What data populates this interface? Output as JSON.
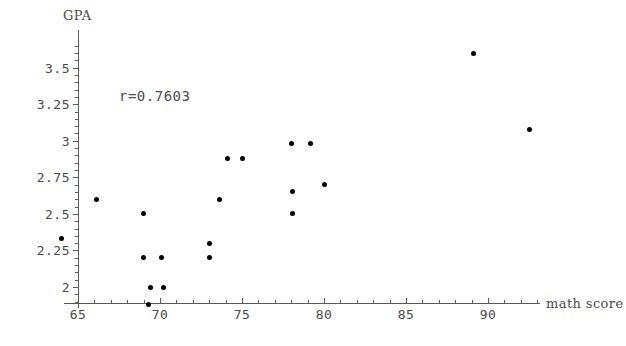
{
  "chart_data": {
    "type": "scatter",
    "title": "",
    "xlabel": "math score",
    "ylabel": "GPA",
    "xlim": [
      63.2,
      92.2
    ],
    "ylim": [
      1.88,
      3.72
    ],
    "xticks": [
      65,
      70,
      75,
      80,
      85,
      90
    ],
    "xtick_labels": [
      "65",
      "70",
      "75",
      "80",
      "85",
      "90"
    ],
    "yticks": [
      2,
      2.25,
      2.5,
      2.75,
      3,
      3.25,
      3.5
    ],
    "ytick_labels": [
      "2",
      "2.25",
      "2.5",
      "2.75",
      "3",
      "3.25",
      "3.5"
    ],
    "grid": false,
    "legend": null,
    "annotations": [
      {
        "name": "correlation",
        "text": "r=0.7603",
        "x": 66.5,
        "y": 3.23
      }
    ],
    "series": [
      {
        "name": "students",
        "marker": "circle",
        "color": "#000000",
        "points": [
          {
            "x": 64.0,
            "y": 2.33
          },
          {
            "x": 66.1,
            "y": 2.6
          },
          {
            "x": 69.0,
            "y": 2.5
          },
          {
            "x": 69.0,
            "y": 2.2
          },
          {
            "x": 69.3,
            "y": 1.88
          },
          {
            "x": 69.4,
            "y": 2.0
          },
          {
            "x": 70.1,
            "y": 2.2
          },
          {
            "x": 70.2,
            "y": 2.0
          },
          {
            "x": 73.0,
            "y": 2.3
          },
          {
            "x": 73.0,
            "y": 2.2
          },
          {
            "x": 73.6,
            "y": 2.6
          },
          {
            "x": 74.1,
            "y": 2.88
          },
          {
            "x": 75.0,
            "y": 2.88
          },
          {
            "x": 78.0,
            "y": 2.98
          },
          {
            "x": 78.1,
            "y": 2.65
          },
          {
            "x": 78.1,
            "y": 2.5
          },
          {
            "x": 79.2,
            "y": 2.98
          },
          {
            "x": 80.0,
            "y": 2.7
          },
          {
            "x": 89.1,
            "y": 3.6
          },
          {
            "x": 92.5,
            "y": 3.08
          }
        ]
      }
    ]
  },
  "axis_colors": {
    "line": "#5a5a5a",
    "text": "#4a4a4a",
    "marker": "#000000"
  }
}
